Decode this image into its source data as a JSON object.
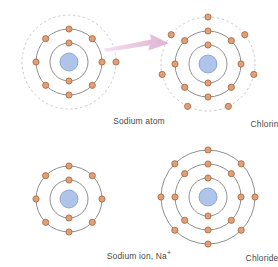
{
  "figure": {
    "background_color": "#ffffff",
    "palette": {
      "electron_fill": "#e0a077",
      "electron_stroke": "#a9613a",
      "nucleus_fill": "#aec4e8",
      "nucleus_stroke": "#7f9ad0",
      "shell_stroke": "#6b6b6b",
      "dashed_shell_stroke": "#b9b4ba",
      "arrow_color": "#e6c3dd",
      "label_color": "#4a4a4a"
    }
  },
  "panels": [
    {
      "id": "sodium-atom",
      "label": "Sodium atom",
      "label_suffix": "",
      "center": {
        "x": 69,
        "y": 62
      },
      "nucleus_radius": 9,
      "shells": [
        {
          "radius": 19,
          "electrons": 2,
          "style": "solid",
          "start_angle": 90
        },
        {
          "radius": 33,
          "electrons": 8,
          "style": "solid",
          "start_angle": 90
        },
        {
          "radius": 47,
          "electrons": 1,
          "style": "dashed",
          "start_angle": 0
        }
      ]
    },
    {
      "id": "chlorine-atom",
      "label": "Chlorine atom",
      "label_suffix": "",
      "center": {
        "x": 208,
        "y": 64
      },
      "nucleus_radius": 9,
      "shells": [
        {
          "radius": 19,
          "electrons": 2,
          "style": "solid",
          "start_angle": 90
        },
        {
          "radius": 33,
          "electrons": 8,
          "style": "solid",
          "start_angle": 90
        },
        {
          "radius": 47,
          "electrons": 7,
          "style": "dashed",
          "start_angle": 90
        }
      ]
    },
    {
      "id": "sodium-ion",
      "label": "Sodium ion, Na",
      "label_suffix": "+",
      "center": {
        "x": 69,
        "y": 199
      },
      "nucleus_radius": 9,
      "shells": [
        {
          "radius": 19,
          "electrons": 2,
          "style": "solid",
          "start_angle": 90
        },
        {
          "radius": 33,
          "electrons": 8,
          "style": "solid",
          "start_angle": 90
        }
      ]
    },
    {
      "id": "chloride-ion",
      "label": "Chloride ion, Cl",
      "label_suffix": "−",
      "center": {
        "x": 208,
        "y": 197
      },
      "nucleus_radius": 9,
      "shells": [
        {
          "radius": 19,
          "electrons": 2,
          "style": "solid",
          "start_angle": 90
        },
        {
          "radius": 33,
          "electrons": 8,
          "style": "solid",
          "start_angle": 90
        },
        {
          "radius": 47,
          "electrons": 8,
          "style": "solid",
          "start_angle": 90
        }
      ]
    }
  ],
  "arrow": {
    "name": "electron-transfer-arrow",
    "from_panel": "sodium-atom",
    "to_panel": "chlorine-atom",
    "direction": "left-to-right",
    "color": "#e6c3dd"
  }
}
